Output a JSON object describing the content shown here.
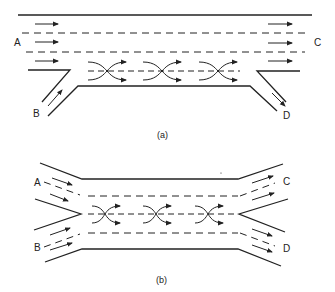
{
  "diagram_a": {
    "labels": {
      "A": "A",
      "B": "B",
      "C": "C",
      "D": "D"
    },
    "caption": "(a)"
  },
  "diagram_b": {
    "labels": {
      "A": "A",
      "B": "B",
      "C": "C",
      "D": "D"
    },
    "caption": "(b)"
  },
  "colors": {
    "stroke": "#222222",
    "background": "#ffffff"
  }
}
